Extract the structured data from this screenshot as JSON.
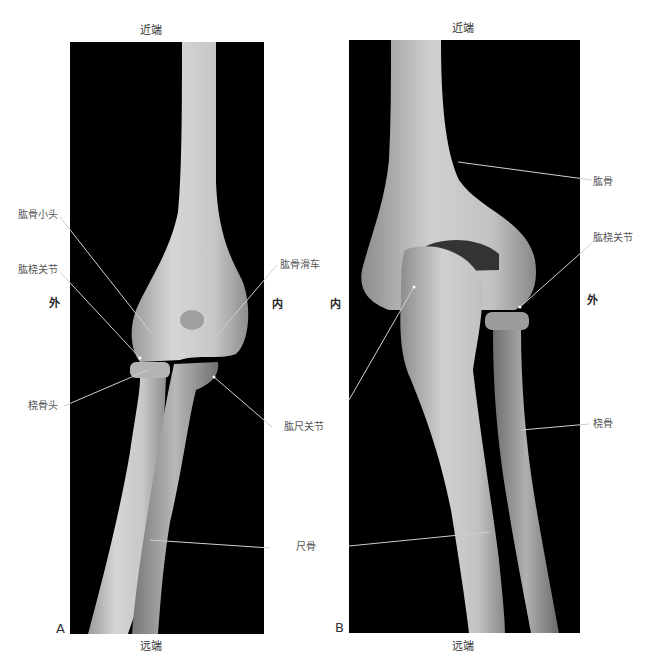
{
  "figure": {
    "panel_a": {
      "tag": "A",
      "proximal_label": "近端",
      "distal_label": "远端",
      "lateral_label": "外",
      "medial_label": "内",
      "annotations": [
        {
          "text": "肱骨小头",
          "meaning": "capitulum of humerus"
        },
        {
          "text": "肱桡关节",
          "meaning": "humeroradial joint"
        },
        {
          "text": "桡骨头",
          "meaning": "radial head"
        },
        {
          "text": "肱骨滑车",
          "meaning": "trochlea of humerus"
        },
        {
          "text": "肱尺关节",
          "meaning": "humeroulnar joint"
        }
      ]
    },
    "shared": {
      "ulna_label": "尺骨"
    },
    "panel_b": {
      "tag": "B",
      "proximal_label": "近端",
      "distal_label": "远端",
      "lateral_label": "外",
      "medial_label": "内",
      "annotations": [
        {
          "text": "肱骨",
          "meaning": "humerus"
        },
        {
          "text": "肱桡关节",
          "meaning": "humeroradial joint"
        },
        {
          "text": "桡骨",
          "meaning": "radius"
        }
      ]
    },
    "colors": {
      "background": "#000000",
      "bone": "#cfcfcf",
      "leader_line": "#d8d8d8",
      "label_text": "#555555"
    }
  }
}
